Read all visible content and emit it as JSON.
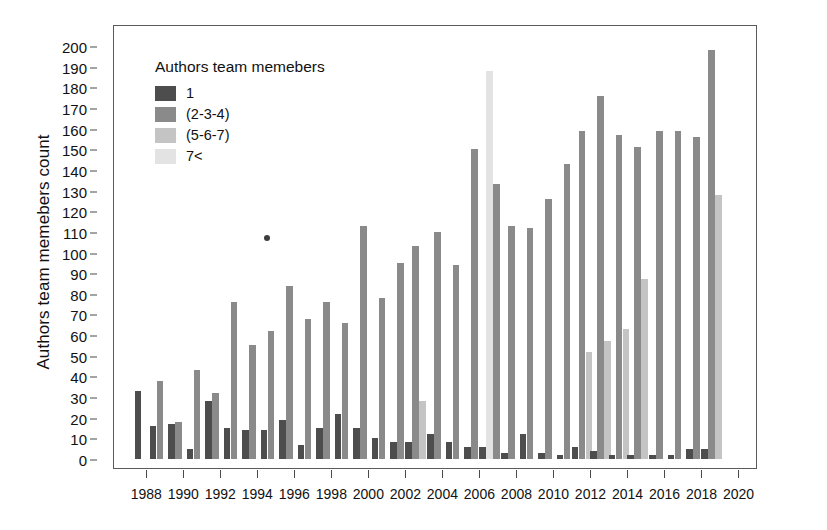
{
  "chart_data": {
    "type": "bar",
    "title": "",
    "xlabel": "",
    "ylabel": "Authors team memebers count",
    "ylim": [
      0,
      205
    ],
    "ytick_step": 10,
    "grid": false,
    "legend_title": "Authors team memebers",
    "legend_position": "top-left-inside",
    "yticks": [
      0,
      10,
      20,
      30,
      40,
      50,
      60,
      70,
      80,
      90,
      100,
      110,
      120,
      130,
      140,
      150,
      160,
      170,
      180,
      190,
      200
    ],
    "xticks": [
      1988,
      1990,
      1992,
      1994,
      1996,
      1998,
      2000,
      2002,
      2004,
      2006,
      2008,
      2010,
      2012,
      2014,
      2016,
      2018,
      2020
    ],
    "categories": [
      1987,
      1988,
      1989,
      1990,
      1991,
      1992,
      1993,
      1994,
      1995,
      1996,
      1997,
      1998,
      1999,
      2000,
      2001,
      2002,
      2003,
      2004,
      2005,
      2006,
      2007,
      2008,
      2009,
      2010,
      2011,
      2012,
      2013,
      2014,
      2015,
      2016,
      2017,
      2018,
      2019,
      2020
    ],
    "series": [
      {
        "name": "1",
        "color": "#4d4d4d",
        "values": [
          33,
          16,
          0,
          28,
          15,
          14,
          14,
          19,
          7,
          15,
          22,
          15,
          10,
          8,
          8,
          12,
          3,
          3,
          6,
          2,
          2,
          2,
          2,
          2,
          3,
          0,
          0,
          0,
          0,
          0,
          0,
          0,
          0,
          0
        ]
      },
      {
        "name": "(2-3-4)",
        "color": "#8a8a8a",
        "values": [
          0,
          38,
          18,
          43,
          32,
          76,
          55,
          62,
          84,
          68,
          76,
          66,
          113,
          78,
          95,
          103,
          110,
          94,
          150,
          133,
          113,
          112,
          126,
          143,
          159,
          176,
          157,
          151,
          159,
          159,
          156,
          198,
          0,
          0
        ]
      },
      {
        "name": "(5-6-7)",
        "color": "#c4c4c4",
        "values": [
          0,
          0,
          0,
          0,
          0,
          0,
          0,
          0,
          0,
          0,
          0,
          0,
          0,
          0,
          0,
          0,
          28,
          0,
          0,
          0,
          0,
          0,
          0,
          0,
          52,
          57,
          63,
          87,
          0,
          0,
          0,
          128,
          0,
          0
        ]
      },
      {
        "name": "7<",
        "color": "#e3e3e3",
        "values": [
          0,
          0,
          5,
          0,
          0,
          0,
          0,
          0,
          0,
          0,
          0,
          0,
          0,
          0,
          0,
          0,
          0,
          0,
          0,
          188,
          0,
          0,
          0,
          0,
          0,
          0,
          0,
          0,
          0,
          0,
          0,
          0,
          0,
          0
        ]
      }
    ],
    "bar_groups": [
      {
        "year": 1987,
        "bars": [
          {
            "series": "1",
            "value": 33
          }
        ]
      },
      {
        "year": 1988,
        "bars": [
          {
            "series": "1",
            "value": 16
          },
          {
            "series": "(2-3-4)",
            "value": 38
          }
        ]
      },
      {
        "year": 1989,
        "bars": [
          {
            "series": "1",
            "value": 17
          },
          {
            "series": "(2-3-4)",
            "value": 18
          }
        ]
      },
      {
        "year": 1990,
        "bars": [
          {
            "series": "1",
            "value": 5
          },
          {
            "series": "(2-3-4)",
            "value": 43
          }
        ]
      },
      {
        "year": 1991,
        "bars": [
          {
            "series": "1",
            "value": 28
          },
          {
            "series": "(2-3-4)",
            "value": 32
          }
        ]
      },
      {
        "year": 1992,
        "bars": [
          {
            "series": "1",
            "value": 15
          },
          {
            "series": "(2-3-4)",
            "value": 76
          }
        ]
      },
      {
        "year": 1993,
        "bars": [
          {
            "series": "1",
            "value": 14
          },
          {
            "series": "(2-3-4)",
            "value": 55
          }
        ]
      },
      {
        "year": 1994,
        "bars": [
          {
            "series": "1",
            "value": 14
          },
          {
            "series": "(2-3-4)",
            "value": 62
          }
        ]
      },
      {
        "year": 1995,
        "bars": [
          {
            "series": "1",
            "value": 19
          },
          {
            "series": "(2-3-4)",
            "value": 84
          }
        ]
      },
      {
        "year": 1996,
        "bars": [
          {
            "series": "1",
            "value": 7
          },
          {
            "series": "(2-3-4)",
            "value": 68
          }
        ]
      },
      {
        "year": 1997,
        "bars": [
          {
            "series": "1",
            "value": 15
          },
          {
            "series": "(2-3-4)",
            "value": 76
          }
        ]
      },
      {
        "year": 1998,
        "bars": [
          {
            "series": "1",
            "value": 22
          },
          {
            "series": "(2-3-4)",
            "value": 66
          }
        ]
      },
      {
        "year": 1999,
        "bars": [
          {
            "series": "1",
            "value": 15
          },
          {
            "series": "(2-3-4)",
            "value": 113
          }
        ]
      },
      {
        "year": 2000,
        "bars": [
          {
            "series": "1",
            "value": 10
          },
          {
            "series": "(2-3-4)",
            "value": 78
          }
        ]
      },
      {
        "year": 2001,
        "bars": [
          {
            "series": "1",
            "value": 8
          },
          {
            "series": "(2-3-4)",
            "value": 95
          }
        ]
      },
      {
        "year": 2002,
        "bars": [
          {
            "series": "1",
            "value": 8
          },
          {
            "series": "(2-3-4)",
            "value": 103
          },
          {
            "series": "(5-6-7)",
            "value": 28
          }
        ]
      },
      {
        "year": 2003,
        "bars": [
          {
            "series": "1",
            "value": 12
          },
          {
            "series": "(2-3-4)",
            "value": 110
          }
        ]
      },
      {
        "year": 2004,
        "bars": [
          {
            "series": "1",
            "value": 8
          },
          {
            "series": "(2-3-4)",
            "value": 94
          }
        ]
      },
      {
        "year": 2005,
        "bars": [
          {
            "series": "1",
            "value": 6
          },
          {
            "series": "(2-3-4)",
            "value": 150
          }
        ]
      },
      {
        "year": 2006,
        "bars": [
          {
            "series": "1",
            "value": 6
          },
          {
            "series": "7<",
            "value": 188
          },
          {
            "series": "(2-3-4)",
            "value": 133
          }
        ]
      },
      {
        "year": 2007,
        "bars": [
          {
            "series": "1",
            "value": 3
          },
          {
            "series": "(2-3-4)",
            "value": 113
          }
        ]
      },
      {
        "year": 2008,
        "bars": [
          {
            "series": "1",
            "value": 12
          },
          {
            "series": "(2-3-4)",
            "value": 112
          }
        ]
      },
      {
        "year": 2009,
        "bars": [
          {
            "series": "1",
            "value": 3
          },
          {
            "series": "(2-3-4)",
            "value": 126
          }
        ]
      },
      {
        "year": 2010,
        "bars": [
          {
            "series": "1",
            "value": 2
          },
          {
            "series": "(2-3-4)",
            "value": 143
          }
        ]
      },
      {
        "year": 2011,
        "bars": [
          {
            "series": "1",
            "value": 6
          },
          {
            "series": "(2-3-4)",
            "value": 159
          },
          {
            "series": "(5-6-7)",
            "value": 52
          }
        ]
      },
      {
        "year": 2012,
        "bars": [
          {
            "series": "1",
            "value": 4
          },
          {
            "series": "(2-3-4)",
            "value": 176
          },
          {
            "series": "(5-6-7)",
            "value": 57
          }
        ]
      },
      {
        "year": 2013,
        "bars": [
          {
            "series": "1",
            "value": 2
          },
          {
            "series": "(2-3-4)",
            "value": 157
          },
          {
            "series": "(5-6-7)",
            "value": 63
          }
        ]
      },
      {
        "year": 2014,
        "bars": [
          {
            "series": "1",
            "value": 2
          },
          {
            "series": "(2-3-4)",
            "value": 151
          },
          {
            "series": "(5-6-7)",
            "value": 87
          }
        ]
      },
      {
        "year": 2015,
        "bars": [
          {
            "series": "1",
            "value": 2
          },
          {
            "series": "(2-3-4)",
            "value": 159
          }
        ]
      },
      {
        "year": 2016,
        "bars": [
          {
            "series": "1",
            "value": 2
          },
          {
            "series": "(2-3-4)",
            "value": 159
          }
        ]
      },
      {
        "year": 2017,
        "bars": [
          {
            "series": "1",
            "value": 5
          },
          {
            "series": "(2-3-4)",
            "value": 156
          }
        ]
      },
      {
        "year": 2018,
        "bars": [
          {
            "series": "1",
            "value": 5
          },
          {
            "series": "(2-3-4)",
            "value": 198
          },
          {
            "series": "(5-6-7)",
            "value": 128
          }
        ]
      }
    ],
    "annotations": [
      {
        "type": "point",
        "x": 1994,
        "y": 107,
        "label": ""
      }
    ]
  },
  "legend": {
    "title": "Authors team memebers",
    "items": [
      {
        "label": "1",
        "color": "#4d4d4d"
      },
      {
        "label": "(2-3-4)",
        "color": "#8a8a8a"
      },
      {
        "label": "(5-6-7)",
        "color": "#c4c4c4"
      },
      {
        "label": "7<",
        "color": "#e3e3e3"
      }
    ]
  },
  "axes": {
    "y_title": "Authors team memebers count"
  }
}
